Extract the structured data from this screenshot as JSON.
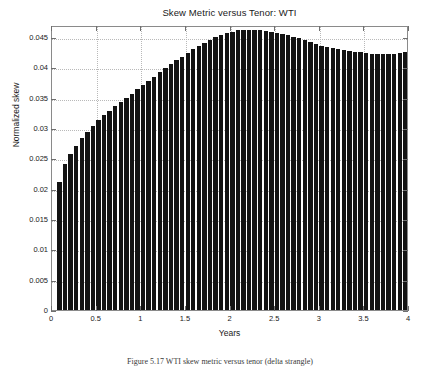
{
  "figure": {
    "caption": "Figure 5.17  WTI skew metric versus tenor (delta strangle)"
  },
  "chart_data": {
    "type": "bar",
    "title": "Skew Metric versus Tenor: WTI",
    "xlabel": "Years",
    "ylabel": "Normalized skew",
    "xlim": [
      0,
      4
    ],
    "ylim": [
      0,
      0.047
    ],
    "grid": true,
    "legend": null,
    "bar_color": "#131313",
    "background_color": "#ffffff",
    "gridline_color": "#b9b9b9",
    "axis_color": "#8a8a8a",
    "xticks": [
      0,
      0.5,
      1,
      1.5,
      2,
      2.5,
      3,
      3.5,
      4
    ],
    "xtick_labels": [
      "0",
      "0.5",
      "1",
      "1.5",
      "2",
      "2.5",
      "3",
      "3.5",
      "4"
    ],
    "yticks": [
      0,
      0.005,
      0.01,
      0.015,
      0.02,
      0.025,
      0.03,
      0.035,
      0.04,
      0.045
    ],
    "ytick_labels": [
      "0",
      "0.005",
      "0.01",
      "0.015",
      "0.02",
      "0.025",
      "0.03",
      "0.035",
      "0.04",
      "0.045"
    ],
    "x": [
      0.083,
      0.146,
      0.208,
      0.271,
      0.333,
      0.396,
      0.458,
      0.521,
      0.583,
      0.646,
      0.708,
      0.771,
      0.833,
      0.896,
      0.958,
      1.021,
      1.083,
      1.146,
      1.208,
      1.271,
      1.333,
      1.396,
      1.458,
      1.521,
      1.583,
      1.646,
      1.708,
      1.771,
      1.833,
      1.896,
      1.958,
      2.021,
      2.083,
      2.146,
      2.208,
      2.271,
      2.333,
      2.396,
      2.458,
      2.521,
      2.583,
      2.646,
      2.708,
      2.771,
      2.833,
      2.896,
      2.958,
      3.021,
      3.083,
      3.146,
      3.208,
      3.271,
      3.333,
      3.396,
      3.458,
      3.521,
      3.583,
      3.646,
      3.708,
      3.771,
      3.833,
      3.896,
      3.958
    ],
    "values": [
      0.0211,
      0.024,
      0.0258,
      0.0271,
      0.0283,
      0.0294,
      0.0304,
      0.0313,
      0.0321,
      0.0329,
      0.0336,
      0.0343,
      0.035,
      0.0357,
      0.0364,
      0.0371,
      0.0378,
      0.0385,
      0.0392,
      0.0399,
      0.0406,
      0.0412,
      0.0418,
      0.0424,
      0.043,
      0.0436,
      0.0441,
      0.0446,
      0.045,
      0.0454,
      0.0457,
      0.0459,
      0.0461,
      0.0462,
      0.0462,
      0.0462,
      0.0461,
      0.046,
      0.0459,
      0.0457,
      0.0455,
      0.0453,
      0.0451,
      0.0448,
      0.0445,
      0.0442,
      0.0439,
      0.0436,
      0.0434,
      0.0432,
      0.043,
      0.0428,
      0.0427,
      0.0426,
      0.0425,
      0.0424,
      0.0423,
      0.0422,
      0.0422,
      0.0422,
      0.0423,
      0.0424,
      0.0425
    ]
  }
}
